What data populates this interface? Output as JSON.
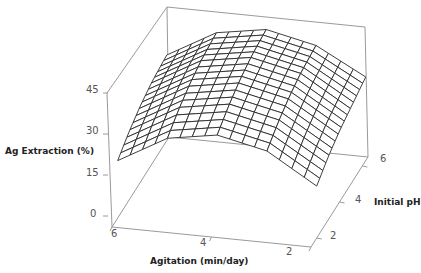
{
  "chart_data": {
    "type": "surface3d",
    "title": "",
    "xlabel": "Agitation (min/day)",
    "ylabel": "Initial pH",
    "zlabel": "Ag Extraction (%)",
    "x_ticks": [
      "6",
      "4",
      "2"
    ],
    "y_ticks": [
      "2",
      "4",
      "6"
    ],
    "z_ticks": [
      "45",
      "30",
      "15",
      "0"
    ],
    "xlim": [
      2,
      6
    ],
    "ylim": [
      1.5,
      6.5
    ],
    "zlim": [
      0,
      45
    ],
    "grid": false,
    "legend": "none",
    "mesh_resolution": [
      16,
      16
    ],
    "x": [
      2,
      3,
      4,
      5,
      6
    ],
    "y": [
      2,
      3,
      4,
      5,
      6
    ],
    "z": [
      [
        19,
        23,
        26,
        28,
        30
      ],
      [
        30,
        34,
        37,
        39,
        40
      ],
      [
        34,
        38,
        41,
        43,
        44
      ],
      [
        31,
        35,
        38,
        40,
        41
      ],
      [
        21,
        25,
        28,
        30,
        31
      ]
    ],
    "z_description": "rows = agitation 2..6, cols = initial pH 2..6; ridge-shaped response maximal near agitation 4 min/day and high pH"
  },
  "colors": {
    "axes": "#9a9a9a",
    "mesh": "#2a2a2a",
    "surface_fill": "#ffffff",
    "tick_text": "#555555",
    "label_text": "#222222"
  }
}
